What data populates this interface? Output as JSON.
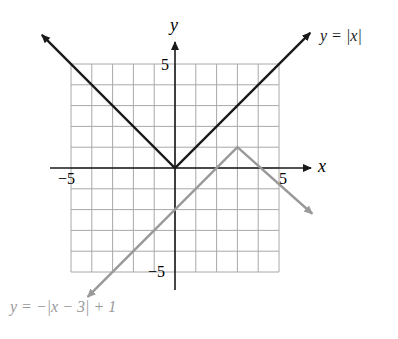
{
  "chart_data": {
    "type": "line",
    "title": "",
    "xlabel": "x",
    "ylabel": "y",
    "xlim": [
      -6,
      7
    ],
    "ylim": [
      -6,
      6
    ],
    "grid": true,
    "grid_range": {
      "x": [
        -5,
        5
      ],
      "y": [
        -5,
        5
      ]
    },
    "tick_labels": {
      "x": [
        "-5",
        "5"
      ],
      "y": [
        "5",
        "-5"
      ]
    },
    "series": [
      {
        "name": "y = |x|",
        "color": "#1a1a1a",
        "points": [
          [
            -6.4,
            6.4
          ],
          [
            0,
            0
          ],
          [
            6.5,
            6.5
          ]
        ]
      },
      {
        "name": "y = −|x − 3| + 1",
        "color": "#999999",
        "points": [
          [
            -4.2,
            -6.2
          ],
          [
            3,
            1
          ],
          [
            6.6,
            -2.2
          ]
        ]
      }
    ],
    "annotations": [
      {
        "text": "y = |x|",
        "near_series": 0
      },
      {
        "text": "y = −|x − 3| + 1",
        "near_series": 1
      }
    ]
  },
  "labels": {
    "y_axis": "y",
    "x_axis": "x",
    "y_tick_top": "5",
    "y_tick_bottom": "−5",
    "x_tick_left": "−5",
    "x_tick_right": "5",
    "eq1": "y = |x|",
    "eq2": "y = −|x − 3| + 1"
  }
}
